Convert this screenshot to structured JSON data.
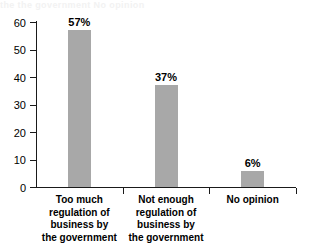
{
  "chart_data": {
    "type": "bar",
    "title": "",
    "subtitle": "",
    "xlabel": "",
    "ylabel": "",
    "ylim": [
      0,
      60
    ],
    "yticks": [
      0,
      10,
      20,
      30,
      40,
      50,
      60
    ],
    "ytick_labels": [
      "0",
      "10",
      "20",
      "30",
      "40",
      "50",
      "60"
    ],
    "grid": false,
    "legend": null,
    "categories": [
      "Too much regulation of business by the government",
      "Not enough regulation of business by the government",
      "No opinion"
    ],
    "category_label_lines": [
      [
        "Too much",
        "regulation of",
        "business by",
        "the government"
      ],
      [
        "Not enough",
        "regulation of",
        "business by",
        "the government"
      ],
      [
        "No opinion"
      ]
    ],
    "values": [
      57,
      37,
      6
    ],
    "data_labels": [
      "57%",
      "37%",
      "6%"
    ],
    "bar_color": "#a8a8a8",
    "axis_color": "#1a1a1a",
    "background_color": "#ffffff"
  },
  "artifacts": {
    "top_bleed_text": "the the government    No opinion"
  }
}
